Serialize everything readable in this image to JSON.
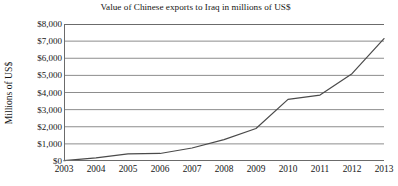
{
  "chart_data": {
    "type": "line",
    "title": "Value of Chinese exports to Iraq in millions of US$",
    "xlabel": "",
    "ylabel": "Millions of US$",
    "x": [
      2003,
      2004,
      2005,
      2006,
      2007,
      2008,
      2009,
      2010,
      2011,
      2012,
      2013
    ],
    "categories": [
      "2003",
      "2004",
      "2005",
      "2006",
      "2007",
      "2008",
      "2009",
      "2010",
      "2011",
      "2012",
      "2013"
    ],
    "values": [
      20,
      180,
      420,
      440,
      760,
      1250,
      1900,
      3600,
      3850,
      5100,
      7150
    ],
    "series": [
      {
        "name": "Chinese exports to Iraq",
        "values": [
          20,
          180,
          420,
          440,
          760,
          1250,
          1900,
          3600,
          3850,
          5100,
          7150
        ]
      }
    ],
    "ylim": [
      0,
      8000
    ],
    "xlim": [
      2003,
      2013
    ],
    "ytick_values": [
      0,
      1000,
      2000,
      3000,
      4000,
      5000,
      6000,
      7000,
      8000
    ],
    "ytick_labels": [
      "$0",
      "$1,000",
      "$2,000",
      "$3,000",
      "$4,000",
      "$5,000",
      "$6,000",
      "$7,000",
      "$8,000"
    ],
    "xtick_labels": [
      "2003",
      "2004",
      "2005",
      "2006",
      "2007",
      "2008",
      "2009",
      "2010",
      "2011",
      "2012",
      "2013"
    ],
    "grid": true,
    "grid_axis": "y",
    "legend": false,
    "legend_position": "none",
    "line_color": "#4a4a4a",
    "grid_color": "#8d8d8d",
    "axis_color": "#6b6b6b",
    "background_color": "#ffffff",
    "text_color": "#161616"
  }
}
